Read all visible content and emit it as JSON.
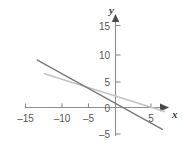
{
  "chart_data": {
    "type": "line",
    "title": "",
    "xlabel": "x",
    "ylabel": "y",
    "grid": false,
    "legend": "none",
    "xlim": [
      -17,
      7.5
    ],
    "ylim": [
      -6,
      17
    ],
    "xticks": [
      -15,
      -10,
      -5,
      5
    ],
    "yticks": [
      15,
      10,
      5,
      0,
      -5
    ],
    "xtick_labels": [
      "–15",
      "–10",
      "–5",
      "5"
    ],
    "ytick_labels": [
      "15",
      "10",
      "5",
      "0",
      "–5"
    ],
    "origin_label": "0",
    "series": [
      {
        "name": "line-dark",
        "color": "#7c7c7e",
        "x": [
          -11.0,
          6.6
        ],
        "y": [
          9.3,
          -4.3
        ],
        "slope": -0.77,
        "y_intercept": 3.0,
        "x_intercept": 3.9
      },
      {
        "name": "line-light",
        "color": "#c3c3c5",
        "x": [
          -10.0,
          6.9
        ],
        "y": [
          6.6,
          -0.8
        ],
        "slope": -0.44,
        "y_intercept": 2.3,
        "x_intercept": 5.2
      }
    ]
  },
  "axes": {
    "x_axis_color": "#8d8d8f",
    "y_axis_color": "#8d8d8f",
    "x_label": "x",
    "y_label": "y",
    "arrow_x": "arrow-right",
    "arrow_y": "arrow-up"
  }
}
